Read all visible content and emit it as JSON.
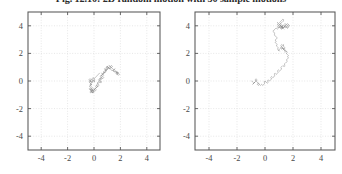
{
  "figure": {
    "caption": "Fig. 12.10:  2D random motion  with  50 sample motions",
    "panel_count": 2
  },
  "style": {
    "trace_color": "#8c8c8c",
    "axis_color": "#585858",
    "grid_color": "#dcdcdc",
    "background": "#ffffff",
    "tick_label_color": "#4a4a4a"
  },
  "chart_data": [
    {
      "type": "line",
      "title": "",
      "xlabel": "",
      "ylabel": "",
      "xlim": [
        -5,
        5
      ],
      "ylim": [
        -5,
        5
      ],
      "xticks": [
        -4,
        -2,
        0,
        2,
        4
      ],
      "yticks": [
        -4,
        -2,
        0,
        2,
        4
      ],
      "xtick_labels": [
        "-4",
        "-2",
        "0",
        "2",
        "4"
      ],
      "ytick_labels": [
        "-4",
        "-2",
        "0",
        "2",
        "4"
      ],
      "grid": true,
      "legend": "none",
      "series": [
        {
          "name": "random-walk-1",
          "x": [
            0.0,
            0.07,
            -0.02,
            -0.11,
            -0.04,
            0.06,
            0.01,
            -0.07,
            -0.16,
            -0.1,
            -0.18,
            -0.27,
            -0.2,
            -0.12,
            -0.21,
            -0.3,
            -0.24,
            -0.16,
            -0.25,
            -0.34,
            -0.28,
            -0.19,
            -0.27,
            -0.36,
            -0.3,
            -0.21,
            -0.13,
            -0.22,
            -0.31,
            -0.24,
            -0.15,
            -0.07,
            -0.16,
            -0.24,
            -0.17,
            -0.08,
            0.01,
            -0.08,
            -0.17,
            -0.09,
            0.0,
            0.09,
            0.18,
            0.1,
            0.01,
            0.1,
            0.19,
            0.28,
            0.2,
            0.12,
            0.21,
            0.3,
            0.39,
            0.31,
            0.23,
            0.32,
            0.41,
            0.5,
            0.42,
            0.34,
            0.43,
            0.52,
            0.61,
            0.53,
            0.45,
            0.54,
            0.63,
            0.55,
            0.47,
            0.56,
            0.65,
            0.74,
            0.66,
            0.58,
            0.67,
            0.76,
            0.85,
            0.77,
            0.69,
            0.78,
            0.87,
            0.96,
            0.88,
            0.8,
            0.89,
            0.98,
            1.07,
            0.99,
            0.91,
            1.0,
            1.09,
            1.18,
            1.1,
            1.02,
            1.11,
            1.2,
            1.29,
            1.21,
            1.13,
            1.22,
            1.31,
            1.4,
            1.32,
            1.24,
            1.33,
            1.42,
            1.51,
            1.6,
            1.52,
            1.44,
            1.53,
            1.62,
            1.71,
            1.8,
            1.72,
            1.64,
            1.73,
            1.82,
            1.74,
            1.66,
            1.75,
            1.84,
            1.93,
            1.85,
            1.77,
            1.86,
            1.78,
            1.7,
            1.62,
            1.54,
            1.46,
            1.38,
            1.3,
            1.22,
            1.14,
            1.06,
            0.98,
            0.9,
            0.98,
            1.06,
            0.98,
            0.9,
            0.82,
            0.9,
            0.82,
            0.74,
            0.66,
            0.58,
            0.66,
            0.74,
            0.66,
            0.58,
            0.5,
            0.42,
            0.5,
            0.58,
            0.5,
            0.42,
            0.34,
            0.26,
            0.18,
            0.26,
            0.18,
            0.1,
            0.02,
            -0.06,
            -0.14,
            -0.06,
            0.02,
            -0.06,
            -0.14,
            -0.22,
            -0.14,
            -0.06,
            -0.14,
            -0.22,
            -0.3,
            -0.22,
            -0.14,
            -0.22,
            -0.3,
            -0.22,
            -0.3,
            -0.38,
            -0.3,
            -0.22,
            -0.3,
            -0.38,
            -0.3,
            -0.22,
            -0.3,
            -0.22,
            -0.14,
            -0.06,
            0.02,
            0.1,
            0.18,
            0.26,
            0.34,
            0.42
          ],
          "y": [
            0.0,
            0.09,
            0.17,
            0.09,
            0.01,
            -0.07,
            0.01,
            0.09,
            0.01,
            -0.07,
            -0.15,
            -0.07,
            0.01,
            -0.07,
            -0.15,
            -0.23,
            -0.31,
            -0.23,
            -0.31,
            -0.39,
            -0.47,
            -0.55,
            -0.63,
            -0.55,
            -0.63,
            -0.71,
            -0.63,
            -0.71,
            -0.79,
            -0.87,
            -0.79,
            -0.87,
            -0.79,
            -0.71,
            -0.79,
            -0.87,
            -0.79,
            -0.71,
            -0.63,
            -0.71,
            -0.63,
            -0.55,
            -0.63,
            -0.71,
            -0.63,
            -0.55,
            -0.47,
            -0.39,
            -0.47,
            -0.39,
            -0.31,
            -0.39,
            -0.31,
            -0.23,
            -0.15,
            -0.07,
            0.01,
            -0.07,
            0.01,
            0.09,
            0.17,
            0.09,
            0.17,
            0.25,
            0.17,
            0.25,
            0.33,
            0.41,
            0.33,
            0.41,
            0.49,
            0.41,
            0.49,
            0.57,
            0.49,
            0.57,
            0.65,
            0.57,
            0.65,
            0.73,
            0.65,
            0.73,
            0.81,
            0.89,
            0.81,
            0.89,
            0.97,
            1.05,
            0.97,
            1.05,
            0.97,
            0.89,
            0.97,
            1.05,
            0.97,
            0.89,
            0.97,
            1.05,
            1.13,
            1.05,
            0.97,
            1.05,
            1.13,
            1.05,
            0.97,
            0.89,
            0.81,
            0.89,
            0.81,
            0.73,
            0.65,
            0.73,
            0.65,
            0.57,
            0.65,
            0.57,
            0.49,
            0.57,
            0.65,
            0.57,
            0.49,
            0.57,
            0.49,
            0.41,
            0.49,
            0.57,
            0.65,
            0.73,
            0.65,
            0.73,
            0.81,
            0.73,
            0.81,
            0.89,
            0.97,
            0.89,
            0.97,
            0.89,
            0.81,
            0.89,
            0.81,
            0.73,
            0.81,
            0.73,
            0.65,
            0.57,
            0.49,
            0.41,
            0.33,
            0.25,
            0.17,
            0.25,
            0.17,
            0.09,
            0.01,
            -0.07,
            -0.15,
            -0.07,
            -0.15,
            -0.23,
            -0.31,
            -0.39,
            -0.47,
            -0.55,
            -0.63,
            -0.55,
            -0.63,
            -0.71,
            -0.79,
            -0.71,
            -0.63,
            -0.71,
            -0.79,
            -0.71,
            -0.63,
            -0.55,
            -0.63,
            -0.55,
            -0.47,
            -0.39,
            -0.31,
            -0.23,
            -0.15,
            -0.07,
            0.01,
            0.09,
            0.17,
            0.09,
            0.01,
            -0.07,
            0.01,
            0.09,
            0.17,
            0.25,
            0.17,
            0.25,
            0.33,
            0.41,
            0.49,
            0.57
          ]
        }
      ]
    },
    {
      "type": "line",
      "title": "",
      "xlabel": "",
      "ylabel": "",
      "xlim": [
        -5,
        5
      ],
      "ylim": [
        -5,
        5
      ],
      "xticks": [
        -4,
        -2,
        0,
        2,
        4
      ],
      "yticks": [
        -4,
        -2,
        0,
        2,
        4
      ],
      "xtick_labels": [
        "-4",
        "-2",
        "0",
        "2",
        "4"
      ],
      "ytick_labels": [
        "-4",
        "-2",
        "0",
        "2",
        "4"
      ],
      "grid": true,
      "legend": "none",
      "series": [
        {
          "name": "random-walk-2",
          "x": [
            -0.95,
            -0.88,
            -0.8,
            -0.88,
            -0.8,
            -0.72,
            -0.8,
            -0.72,
            -0.64,
            -0.72,
            -0.64,
            -0.56,
            -0.64,
            -0.56,
            -0.48,
            -0.56,
            -0.48,
            -0.4,
            -0.48,
            -0.4,
            -0.32,
            -0.24,
            -0.16,
            -0.08,
            0.0,
            -0.08,
            0.0,
            0.08,
            0.16,
            0.24,
            0.16,
            0.24,
            0.32,
            0.4,
            0.48,
            0.4,
            0.48,
            0.56,
            0.64,
            0.72,
            0.64,
            0.72,
            0.8,
            0.88,
            0.96,
            0.88,
            0.96,
            1.04,
            1.12,
            1.2,
            1.12,
            1.2,
            1.28,
            1.36,
            1.44,
            1.36,
            1.44,
            1.52,
            1.6,
            1.52,
            1.6,
            1.68,
            1.6,
            1.68,
            1.6,
            1.52,
            1.6,
            1.52,
            1.44,
            1.52,
            1.44,
            1.36,
            1.44,
            1.36,
            1.28,
            1.36,
            1.28,
            1.2,
            1.28,
            1.2,
            1.12,
            1.2,
            1.12,
            1.2,
            1.28,
            1.36,
            1.28,
            1.36,
            1.44,
            1.36,
            1.28,
            1.2,
            1.12,
            1.04,
            0.96,
            1.04,
            0.96,
            0.88,
            0.96,
            0.88,
            0.8,
            0.88,
            0.8,
            0.72,
            0.8,
            0.72,
            0.8,
            0.88,
            0.8,
            0.72,
            0.64,
            0.72,
            0.64,
            0.56,
            0.64,
            0.72,
            0.8,
            0.88,
            0.96,
            1.04,
            1.12,
            1.2,
            1.28,
            1.2,
            1.28,
            1.36,
            1.44,
            1.52,
            1.44,
            1.52,
            1.6,
            1.68,
            1.6,
            1.68,
            1.6,
            1.52,
            1.44,
            1.36,
            1.28,
            1.2,
            1.12,
            1.04,
            0.96,
            0.88,
            0.96,
            0.88,
            0.96,
            1.04,
            1.12,
            1.2,
            1.28,
            1.36,
            1.44,
            1.52,
            1.6,
            1.68,
            1.76,
            1.68,
            1.6,
            1.52,
            1.44,
            1.36,
            1.44,
            1.36,
            1.28,
            1.2,
            1.28,
            1.2,
            1.12,
            1.2,
            1.12,
            1.04,
            1.12,
            1.2,
            1.28,
            1.36,
            1.28,
            1.2,
            1.12,
            1.04,
            1.12,
            1.04,
            0.96,
            0.88,
            0.96,
            1.04,
            1.12,
            1.2,
            1.28,
            1.2,
            1.12,
            1.04,
            1.12,
            1.2,
            1.28,
            1.2,
            1.12,
            1.2,
            1.28,
            1.36
          ],
          "y": [
            0.0,
            -0.08,
            -0.16,
            -0.24,
            -0.16,
            -0.08,
            -0.16,
            -0.08,
            0.0,
            0.08,
            0.16,
            0.08,
            0.0,
            -0.08,
            -0.16,
            -0.24,
            -0.32,
            -0.24,
            -0.16,
            -0.24,
            -0.32,
            -0.24,
            -0.32,
            -0.24,
            -0.16,
            -0.08,
            0.0,
            -0.08,
            -0.16,
            -0.08,
            0.0,
            0.08,
            0.0,
            0.08,
            0.16,
            0.24,
            0.32,
            0.24,
            0.32,
            0.4,
            0.48,
            0.56,
            0.48,
            0.56,
            0.64,
            0.72,
            0.8,
            0.72,
            0.8,
            0.88,
            0.96,
            1.04,
            1.12,
            1.04,
            1.12,
            1.2,
            1.28,
            1.36,
            1.44,
            1.52,
            1.6,
            1.68,
            1.76,
            1.84,
            1.92,
            2.0,
            2.08,
            2.16,
            2.08,
            2.16,
            2.24,
            2.16,
            2.24,
            2.32,
            2.24,
            2.32,
            2.4,
            2.32,
            2.4,
            2.48,
            2.4,
            2.48,
            2.56,
            2.64,
            2.56,
            2.64,
            2.56,
            2.48,
            2.4,
            2.32,
            2.4,
            2.32,
            2.4,
            2.32,
            2.24,
            2.16,
            2.24,
            2.32,
            2.4,
            2.48,
            2.56,
            2.64,
            2.72,
            2.8,
            2.88,
            2.96,
            3.04,
            3.12,
            3.2,
            3.28,
            3.36,
            3.44,
            3.52,
            3.6,
            3.68,
            3.76,
            3.84,
            3.76,
            3.84,
            3.92,
            4.0,
            3.92,
            4.0,
            3.92,
            3.84,
            3.92,
            4.0,
            4.08,
            4.16,
            4.08,
            4.16,
            4.08,
            4.0,
            3.92,
            3.84,
            3.92,
            4.0,
            3.92,
            3.84,
            3.92,
            4.0,
            3.92,
            4.0,
            4.08,
            4.16,
            4.24,
            4.16,
            4.08,
            4.0,
            3.92,
            3.84,
            3.92,
            4.0,
            3.92,
            3.84,
            3.92,
            4.0,
            4.08,
            4.0,
            3.92,
            3.84,
            3.92,
            4.0,
            4.08,
            4.0,
            3.92,
            3.84,
            3.76,
            3.84,
            3.92,
            4.0,
            4.08,
            4.16,
            4.24,
            4.32,
            4.4,
            4.48,
            4.4,
            4.32,
            4.24,
            4.16,
            4.08,
            4.0,
            3.92,
            3.84,
            3.92,
            3.84,
            3.92,
            4.0,
            4.08,
            4.0,
            3.92,
            3.84,
            3.76,
            3.84,
            3.92,
            4.0,
            3.92,
            3.84,
            3.76
          ]
        }
      ]
    }
  ]
}
